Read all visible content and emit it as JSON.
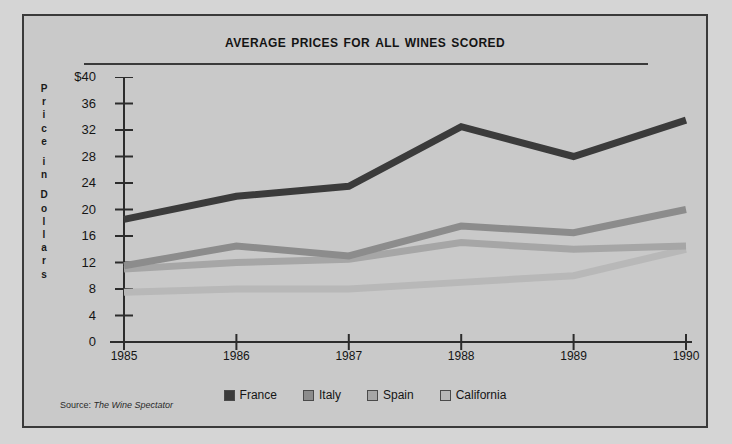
{
  "chart_data": {
    "type": "line",
    "title": "Average Prices for All Wines Scored",
    "xlabel": "",
    "ylabel": "Price in Dollars",
    "categories": [
      "1985",
      "1986",
      "1987",
      "1988",
      "1989",
      "1990"
    ],
    "ylim": [
      0,
      40
    ],
    "yticks": [
      0,
      4,
      8,
      12,
      16,
      20,
      24,
      28,
      32,
      36,
      40
    ],
    "ytick_labels": [
      "0",
      "4",
      "8",
      "12",
      "16",
      "20",
      "24",
      "28",
      "32",
      "36",
      "$40"
    ],
    "grid": false,
    "legend_position": "bottom",
    "series": [
      {
        "name": "France",
        "values": [
          18.5,
          22.0,
          23.5,
          32.5,
          28.0,
          33.5
        ],
        "color": "#3b3b3b"
      },
      {
        "name": "Italy",
        "values": [
          11.5,
          14.5,
          13.0,
          17.5,
          16.5,
          20.0
        ],
        "color": "#8c8c8c"
      },
      {
        "name": "Spain",
        "values": [
          11.0,
          12.0,
          12.5,
          15.0,
          14.0,
          14.5
        ],
        "color": "#a6a6a6"
      },
      {
        "name": "California",
        "values": [
          7.5,
          8.0,
          8.0,
          9.0,
          10.0,
          14.0
        ],
        "color": "#b8b8b8"
      }
    ],
    "source_prefix": "Source:",
    "source_name": "The Wine Spectator"
  },
  "ylabel_letters": [
    "P",
    "r",
    "i",
    "c",
    "e",
    "",
    "i",
    "n",
    "",
    "D",
    "o",
    "l",
    "l",
    "a",
    "r",
    "s"
  ]
}
